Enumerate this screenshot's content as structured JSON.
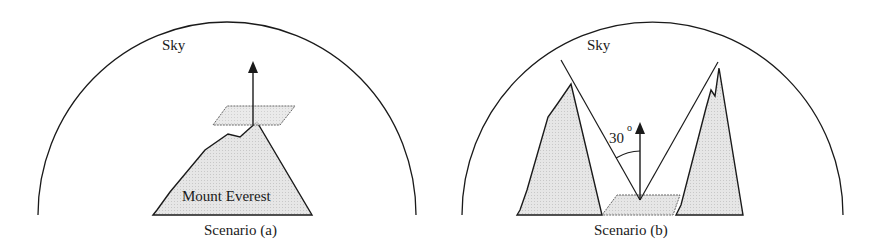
{
  "colors": {
    "stroke": "#1a1a1a",
    "fill": "#e4e4e4",
    "plane_fill": "#d8d8d8",
    "background": "#ffffff"
  },
  "scenario_a": {
    "sky_label": "Sky",
    "mountain_label": "Mount Everest",
    "caption": "Scenario (a)",
    "elements": [
      "sky-dome",
      "mountain",
      "tilted-plane-at-summit",
      "upward-normal-arrow"
    ]
  },
  "scenario_b": {
    "sky_label": "Sky",
    "angle_label": "30",
    "angle_unit": "o",
    "caption": "Scenario (b)",
    "elements": [
      "sky-dome",
      "left-mountain",
      "right-mountain",
      "plane-in-valley",
      "upward-normal-arrow",
      "horizon-sight-lines",
      "angle-arc"
    ]
  }
}
